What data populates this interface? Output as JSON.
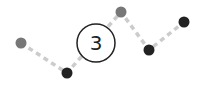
{
  "icon": {
    "name": "step-line-with-number",
    "badge_label": "3",
    "colors": {
      "line": "#cccccc",
      "point_light": "#777777",
      "point_dark": "#222222",
      "badge_stroke": "#222222",
      "badge_fill": "#ffffff",
      "background": "#ffffff"
    },
    "points": [
      {
        "x": 21,
        "y": 43,
        "tone": "light"
      },
      {
        "x": 67,
        "y": 73,
        "tone": "dark"
      },
      {
        "x": 121,
        "y": 12,
        "tone": "light"
      },
      {
        "x": 149,
        "y": 50,
        "tone": "dark"
      },
      {
        "x": 184,
        "y": 22,
        "tone": "dark"
      }
    ],
    "badge": {
      "cx": 96,
      "cy": 43,
      "r": 19
    }
  }
}
